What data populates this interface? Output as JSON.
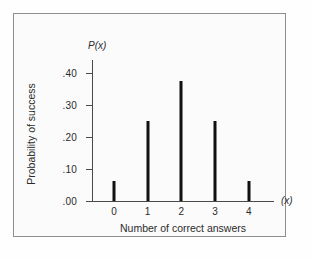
{
  "chart_data": {
    "type": "bar",
    "title": "",
    "subtitle": "",
    "categories": [
      "0",
      "1",
      "2",
      "3",
      "4"
    ],
    "values": [
      0.0625,
      0.25,
      0.375,
      0.25,
      0.0625
    ],
    "xlabel": "Number of correct answers",
    "ylabel": "Probability of success",
    "x_axis_symbol": "(x)",
    "y_axis_symbol": "P(x)",
    "ylim": [
      0.0,
      0.44
    ],
    "xlim": [
      -0.65,
      4.75
    ],
    "ytick_labels": [
      ".40",
      ".30",
      ".20",
      ".10",
      ".00"
    ],
    "ytick_values": [
      0.4,
      0.3,
      0.2,
      0.1,
      0.0
    ],
    "xtick_labels": [
      "0",
      "1",
      "2",
      "3",
      "4"
    ],
    "xtick_values": [
      0,
      1,
      2,
      3,
      4
    ],
    "grid": false,
    "legend": "none",
    "bar_style": "spike",
    "colors": {
      "bar": "#101010",
      "axis": "#4a4a4a",
      "text": "#2b2b2b",
      "frame": "#8e8e8e",
      "plot_background": "#fbfbfb",
      "figure_background": "#fefefe"
    }
  }
}
